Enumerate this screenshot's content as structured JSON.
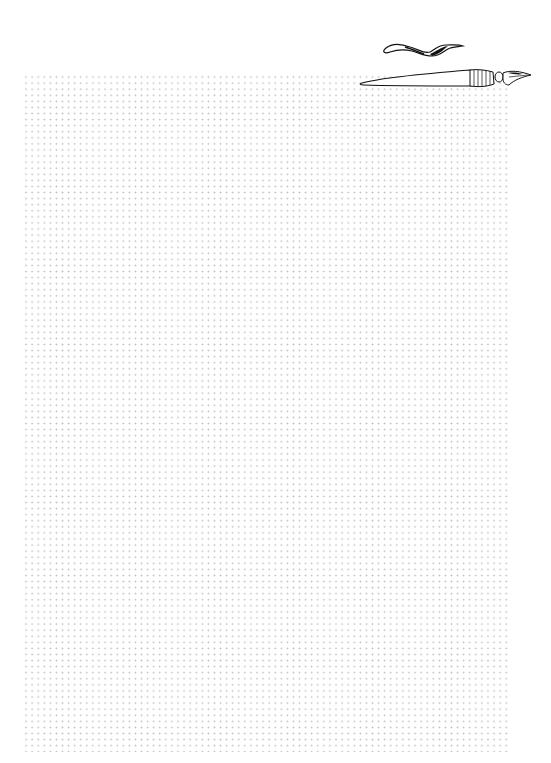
{
  "page": {
    "type": "dot-grid notebook page",
    "background_color": "#ffffff",
    "dot_color": "#c4c4c4",
    "grid": {
      "left": 23,
      "top": 74,
      "right": 509,
      "bottom": 752,
      "spacing_px": 6
    }
  },
  "decorations": [
    {
      "icon": "ink-stroke-icon",
      "color": "#000000"
    },
    {
      "icon": "fountain-pen-icon",
      "color": "#000000"
    }
  ]
}
